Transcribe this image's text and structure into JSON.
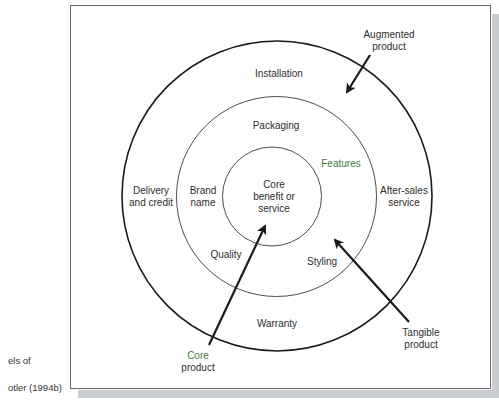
{
  "caption": {
    "line1": "els of",
    "line2": "otler (1994b)"
  },
  "diagram": {
    "rings": {
      "core": {
        "label": [
          "Core",
          "benefit or",
          "service"
        ]
      },
      "tangible": {
        "attributes": [
          "Packaging",
          "Features",
          "Brand",
          "name",
          "Quality",
          "Styling"
        ]
      },
      "augmented": {
        "attributes": [
          "Installation",
          "Delivery",
          "and credit",
          "After-sales",
          "service",
          "Warranty"
        ]
      }
    },
    "callouts": {
      "augmented": [
        "Augmented",
        "product"
      ],
      "tangible": [
        "Tangible",
        "product"
      ],
      "core": [
        "Core",
        "product"
      ]
    },
    "colors": {
      "line": "#1a1a1a",
      "text": "#2e2e2e",
      "accent_green": "#3d7a3a",
      "shadow": "#c9ccd0"
    }
  }
}
